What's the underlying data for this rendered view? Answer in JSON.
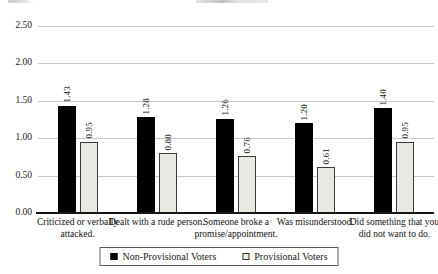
{
  "chart_data": {
    "type": "bar",
    "title": "",
    "xlabel": "",
    "ylabel": "",
    "categories": [
      "Criticized or verbally attacked.",
      "Dealt with a rude person.",
      "Someone broke a promise/appointment.",
      "Was misunderstood.",
      "Did something that you did not want to do."
    ],
    "series": [
      {
        "name": "Non-Provisional Voters",
        "values": [
          1.43,
          1.28,
          1.26,
          1.2,
          1.4
        ]
      },
      {
        "name": "Provisional Voters",
        "values": [
          0.95,
          0.8,
          0.76,
          0.61,
          0.95
        ]
      }
    ],
    "ylim": [
      0,
      2.5
    ],
    "ytick_step": 0.5,
    "ytick_labels": [
      "0.00",
      "0.50",
      "1.00",
      "1.50",
      "2.00",
      "2.50"
    ],
    "grid": true,
    "legend_position": "bottom",
    "value_labels": "rotated-90-two-decimals"
  },
  "colors": {
    "series_fills": [
      "#000000",
      "#e9e9e3"
    ],
    "series_borders": [
      "#000000",
      "#3a3a3a"
    ],
    "gridline": "#c9c9c9",
    "axis": "#161616",
    "legend_border": "#595959",
    "text": "#1a1a1a",
    "background": "#ffffff"
  }
}
